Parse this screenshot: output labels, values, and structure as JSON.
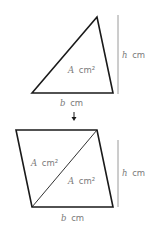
{
  "diagram": {
    "triangle": {
      "area_label": {
        "var": "A",
        "unit": "cm²"
      },
      "height_label": {
        "var": "h",
        "unit": "cm"
      },
      "base_label": {
        "var": "b",
        "unit": "cm"
      }
    },
    "arrow": "down-arrow",
    "parallelogram": {
      "upper_area_label": {
        "var": "A",
        "unit": "cm²"
      },
      "lower_area_label": {
        "var": "A",
        "unit": "cm²"
      },
      "height_label": {
        "var": "h",
        "unit": "cm"
      },
      "base_label": {
        "var": "b",
        "unit": "cm"
      }
    },
    "colors": {
      "shape_stroke": "#1a1a1a",
      "height_line": "#9a9a9a",
      "label_text": "#7a7a7a"
    }
  }
}
